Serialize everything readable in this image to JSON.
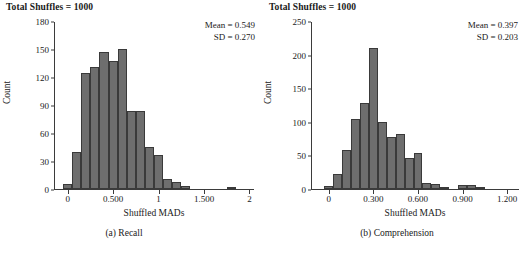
{
  "figure": {
    "background": "#ffffff",
    "bar_fill": "#6e6e6e",
    "bar_stroke": "#3a3a3a",
    "axis_color": "#3b3b3b"
  },
  "panels": [
    {
      "id": "recall",
      "title": "Total Shuffles = 1000",
      "stats": {
        "mean_line": "Mean = 0.549",
        "sd_line": "SD = 0.270"
      },
      "caption": "(a) Recall",
      "chart_data": {
        "type": "bar",
        "title": "Total Shuffles = 1000",
        "xlabel": "Shuffled MADs",
        "ylabel": "Count",
        "xlim": [
          -0.15,
          2.05
        ],
        "ylim": [
          0,
          180
        ],
        "grid": false,
        "legend": "none",
        "xticks": [
          0,
          0.5,
          1,
          1.5,
          2
        ],
        "xtick_labels": [
          "0",
          "0.500",
          "1",
          "1.500",
          "2"
        ],
        "yticks": [
          0,
          30,
          60,
          90,
          120,
          150,
          180
        ],
        "ytick_labels": [
          "0",
          "30",
          "60",
          "90",
          "120",
          "150",
          "180"
        ],
        "bin_width": 0.1,
        "bin_starts": [
          -0.05,
          0.05,
          0.15,
          0.25,
          0.35,
          0.45,
          0.55,
          0.65,
          0.75,
          0.85,
          0.95,
          1.05,
          1.15,
          1.25,
          1.35,
          1.45,
          1.75
        ],
        "categories": [
          "0.00",
          "0.10",
          "0.20",
          "0.30",
          "0.40",
          "0.50",
          "0.60",
          "0.70",
          "0.80",
          "0.90",
          "1.00",
          "1.10",
          "1.20",
          "1.30",
          "1.40",
          "1.50",
          "1.80"
        ],
        "values": [
          5,
          40,
          124,
          131,
          147,
          137,
          150,
          84,
          84,
          45,
          36,
          11,
          8,
          3,
          0,
          0,
          2
        ],
        "annotations": [
          "Mean = 0.549",
          "SD = 0.270"
        ]
      }
    },
    {
      "id": "comprehension",
      "title": "Total Shuffles = 1000",
      "stats": {
        "mean_line": "Mean = 0.397",
        "sd_line": "SD = 0.203"
      },
      "caption": "(b) Comprehension",
      "chart_data": {
        "type": "bar",
        "title": "Total Shuffles = 1000",
        "xlabel": "Shuffled MADs",
        "ylabel": "Count",
        "xlim": [
          -0.12,
          1.28
        ],
        "ylim": [
          0,
          250
        ],
        "grid": false,
        "legend": "none",
        "xticks": [
          0,
          0.3,
          0.6,
          0.9,
          1.2
        ],
        "xtick_labels": [
          "0",
          "0.300",
          "0.600",
          "0.900",
          "1.200"
        ],
        "yticks": [
          0,
          50,
          100,
          150,
          200,
          250
        ],
        "ytick_labels": [
          "0",
          "50",
          "100",
          "150",
          "200",
          "250"
        ],
        "bin_width": 0.06,
        "bin_starts": [
          -0.03,
          0.03,
          0.09,
          0.15,
          0.21,
          0.27,
          0.33,
          0.39,
          0.45,
          0.51,
          0.57,
          0.63,
          0.69,
          0.75,
          0.81,
          0.87,
          0.93,
          0.99,
          1.05
        ],
        "categories": [
          "0.00",
          "0.06",
          "0.12",
          "0.18",
          "0.24",
          "0.30",
          "0.36",
          "0.42",
          "0.48",
          "0.54",
          "0.60",
          "0.66",
          "0.72",
          "0.78",
          "0.84",
          "0.90",
          "0.96",
          "1.02",
          "1.08"
        ],
        "values": [
          5,
          23,
          58,
          104,
          128,
          210,
          99,
          78,
          82,
          46,
          54,
          9,
          8,
          1,
          0,
          6,
          6,
          2,
          0
        ],
        "annotations": [
          "Mean = 0.397",
          "SD = 0.203"
        ]
      }
    }
  ],
  "shared": {
    "xlabel": "Shuffled MADs",
    "ylabel": "Count"
  }
}
